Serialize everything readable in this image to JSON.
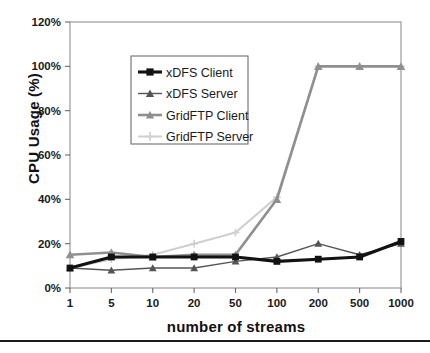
{
  "axes": {
    "ylabel": "CPU Usage (%)",
    "xlabel": "number of streams",
    "yticks": [
      "0%",
      "20%",
      "40%",
      "60%",
      "80%",
      "100%",
      "120%"
    ],
    "xticks": [
      "1",
      "5",
      "10",
      "20",
      "50",
      "100",
      "200",
      "500",
      "1000"
    ]
  },
  "legend": {
    "items": [
      {
        "label": "xDFS Client",
        "color": "#121212",
        "marker": "square"
      },
      {
        "label": "xDFS Server",
        "color": "#555555",
        "marker": "triangle"
      },
      {
        "label": "GridFTP Client",
        "color": "#8f8f8f",
        "marker": "triangle"
      },
      {
        "label": "GridFTP Server",
        "color": "#cfcfcf",
        "marker": "cross"
      }
    ]
  },
  "chart_data": {
    "type": "line",
    "title": "",
    "xlabel": "number of streams",
    "ylabel": "CPU Usage (%)",
    "categories": [
      "1",
      "5",
      "10",
      "20",
      "50",
      "100",
      "200",
      "500",
      "1000"
    ],
    "ylim": [
      0,
      120
    ],
    "ytick_step": 20,
    "grid": false,
    "legend_position": "upper-left-inside",
    "series": [
      {
        "name": "xDFS Client",
        "color": "#121212",
        "marker": "square",
        "values": [
          9,
          14,
          14,
          14,
          14,
          12,
          13,
          14,
          21
        ]
      },
      {
        "name": "xDFS Server",
        "color": "#555555",
        "marker": "triangle",
        "values": [
          9,
          8,
          9,
          9,
          12,
          14,
          20,
          15,
          20
        ]
      },
      {
        "name": "GridFTP Client",
        "color": "#8f8f8f",
        "marker": "triangle",
        "values": [
          15,
          16,
          14,
          15,
          15,
          40,
          100,
          100,
          100
        ]
      },
      {
        "name": "GridFTP Server",
        "color": "#cfcfcf",
        "marker": "cross",
        "values": [
          9,
          13,
          15,
          20,
          25,
          41,
          100,
          100,
          100
        ]
      }
    ]
  }
}
